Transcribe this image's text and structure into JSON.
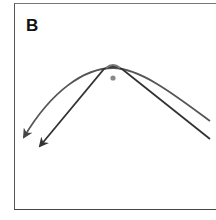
{
  "panel": {
    "label": "B"
  },
  "diagram": {
    "colors": {
      "curve": "#555555",
      "straight": "#333333",
      "dot": "#888888",
      "frame": "#555555"
    },
    "elements": [
      {
        "name": "curved-arrow",
        "type": "parabola",
        "apex": [
          113,
          69
        ],
        "ends": [
          [
            24,
            137
          ],
          [
            210,
            121
          ]
        ],
        "arrowhead": "left-end"
      },
      {
        "name": "straight-arrow",
        "type": "chevron",
        "apex": [
          113,
          68
        ],
        "ends": [
          [
            40,
            146
          ],
          [
            210,
            139
          ]
        ],
        "arrowhead": "left-end"
      },
      {
        "name": "center-dot",
        "type": "dot",
        "center": [
          113,
          78
        ]
      }
    ]
  }
}
